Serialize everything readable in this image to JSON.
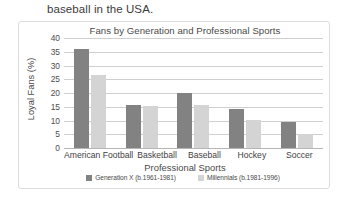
{
  "document": {
    "body_text": "baseball in the USA."
  },
  "chart_data": {
    "type": "bar",
    "title": "Fans by Generation and Professional Sports",
    "xlabel": "Professional Sports",
    "ylabel": "Loyal Fans (%)",
    "categories": [
      "American Football",
      "Basketball",
      "Baseball",
      "Hockey",
      "Soccer"
    ],
    "series": [
      {
        "name": "Generation X (b.1961-1981)",
        "color": "#828282",
        "values": [
          36,
          15.5,
          20,
          14.3,
          9.5
        ]
      },
      {
        "name": "Millennials (b.1981-1996)",
        "color": "#d4d4d4",
        "values": [
          26.5,
          15.3,
          15.5,
          10.3,
          5.2
        ]
      }
    ],
    "ylim": [
      0,
      40
    ],
    "yticks": [
      40,
      35,
      30,
      25,
      20,
      15,
      10,
      5,
      0
    ],
    "grid": true,
    "legend_position": "bottom"
  }
}
